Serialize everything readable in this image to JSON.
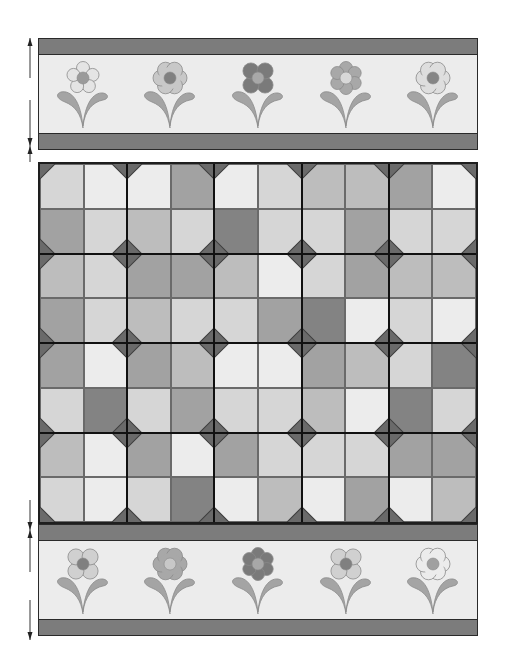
{
  "quilt": {
    "colors": {
      "band": "#7c7c7c",
      "panel": "#ececec",
      "outline": "#2a2a2a",
      "diamond": "#6a6a6a",
      "shades": {
        "L": "#ececec",
        "l": "#d6d6d6",
        "m": "#bdbdbd",
        "d": "#a2a2a2",
        "D": "#838383"
      }
    },
    "top_border": {
      "flowers": [
        {
          "style": "round-petal-5",
          "petal": "#e4e4e4",
          "center": "#9a9a9a"
        },
        {
          "style": "scalloped",
          "petal": "#c8c8c8",
          "center": "#808080"
        },
        {
          "style": "round-petal-4",
          "petal": "#7a7a7a",
          "center": "#a8a8a8"
        },
        {
          "style": "round-petal-6",
          "petal": "#a8a8a8",
          "center": "#d8d8d8"
        },
        {
          "style": "scalloped",
          "petal": "#dedede",
          "center": "#858585"
        }
      ]
    },
    "grid": {
      "columns": 10,
      "rows": 8,
      "blocks_x": 5,
      "blocks_y": 4,
      "shades": [
        [
          "l",
          "L",
          "L",
          "d",
          "L",
          "l",
          "m",
          "m",
          "d",
          "L"
        ],
        [
          "d",
          "l",
          "m",
          "l",
          "D",
          "l",
          "l",
          "d",
          "l",
          "l"
        ],
        [
          "m",
          "l",
          "d",
          "d",
          "m",
          "L",
          "l",
          "d",
          "m",
          "m"
        ],
        [
          "d",
          "l",
          "m",
          "l",
          "l",
          "d",
          "D",
          "L",
          "l",
          "L"
        ],
        [
          "d",
          "L",
          "d",
          "m",
          "L",
          "L",
          "d",
          "m",
          "l",
          "D"
        ],
        [
          "l",
          "D",
          "l",
          "d",
          "l",
          "l",
          "m",
          "L",
          "D",
          "l"
        ],
        [
          "m",
          "L",
          "d",
          "L",
          "d",
          "l",
          "l",
          "l",
          "d",
          "d"
        ],
        [
          "l",
          "L",
          "l",
          "D",
          "L",
          "m",
          "L",
          "d",
          "L",
          "m"
        ]
      ]
    },
    "bottom_border": {
      "flowers": [
        {
          "style": "round-petal-4",
          "petal": "#d0d0d0",
          "center": "#808080"
        },
        {
          "style": "scalloped",
          "petal": "#a8a8a8",
          "center": "#c8c8c8"
        },
        {
          "style": "round-petal-6",
          "petal": "#7a7a7a",
          "center": "#a8a8a8"
        },
        {
          "style": "round-petal-4",
          "petal": "#d0d0d0",
          "center": "#808080"
        },
        {
          "style": "scalloped",
          "petal": "#ececec",
          "center": "#a0a0a0"
        }
      ]
    },
    "arrows": [
      {
        "from": 38,
        "to": 78,
        "dir": "up"
      },
      {
        "from": 100,
        "to": 146,
        "dir": "down"
      },
      {
        "from": 146,
        "to": 162,
        "dir": "up"
      },
      {
        "from": 500,
        "to": 530,
        "dir": "down"
      },
      {
        "from": 530,
        "to": 572,
        "dir": "up"
      },
      {
        "from": 600,
        "to": 640,
        "dir": "down"
      }
    ]
  }
}
